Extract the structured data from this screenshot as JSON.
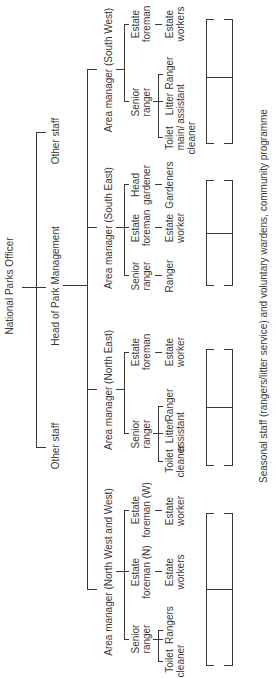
{
  "chart": {
    "top": "National Parks Officer",
    "level1": [
      {
        "label": "Other staff"
      },
      {
        "label": "Head of Park Management"
      },
      {
        "label": "Other staff"
      }
    ],
    "areas": [
      {
        "label": "Area manager (North West and West)",
        "groups": [
          {
            "head": "Senior ranger",
            "children": [
              "Toilet cleaner",
              "Rangers"
            ]
          },
          {
            "head": "Estate foreman (N)",
            "children": [
              "Estate workers"
            ]
          },
          {
            "head": "Estate foreman (W)",
            "children": [
              "Estate worker"
            ]
          }
        ]
      },
      {
        "label": "Area manager (North East)",
        "groups": [
          {
            "head": "Senior ranger",
            "children": [
              "Toilet cleaner",
              "Litter assistant",
              "Ranger"
            ]
          },
          {
            "head": "Estate foreman",
            "children": [
              "Estate worker"
            ]
          }
        ]
      },
      {
        "label": "Area manager (South East)",
        "groups": [
          {
            "head": "Senior ranger",
            "children": [
              "Ranger"
            ]
          },
          {
            "head": "Estate foreman",
            "children": [
              "Estate worker"
            ]
          },
          {
            "head": "Head gardener",
            "children": [
              "Gardeners"
            ]
          }
        ]
      },
      {
        "label": "Area manager (South West)",
        "groups": [
          {
            "head": "Senior ranger",
            "children": [
              "Toilet main/ cleaner",
              "Litter assistant",
              "Ranger"
            ]
          },
          {
            "head": "Estate foreman",
            "children": [
              "Estate workers"
            ]
          }
        ]
      }
    ],
    "footer": "Seasonal staff (rangers/litter service) and voluntary wardens, community programme"
  },
  "labels": {
    "npo": "National Parks Officer",
    "other_left": "Other staff",
    "head": "Head of Park Management",
    "other_right": "Other staff",
    "am_nw": "Area manager (North West and West)",
    "am_ne": "Area manager (North East)",
    "am_se": "Area manager (South East)",
    "am_sw": "Area manager (South West)",
    "senior_ranger": "Senior ranger",
    "toilet_cleaner": "Toilet cleaner",
    "toilet_main_cleaner": "Toilet main/ cleaner",
    "rangers": "Rangers",
    "ranger": "Ranger",
    "litter_assistant": "Litter assistant",
    "estate_foreman": "Estate foreman",
    "estate_foreman_n": "Estate foreman (N)",
    "estate_foreman_w": "Estate foreman (W)",
    "estate_worker": "Estate worker",
    "estate_workers": "Estate workers",
    "head_gardener": "Head gardener",
    "gardeners": "Gardeners",
    "footer": "Seasonal staff (rangers/litter service) and voluntary wardens, community programme"
  }
}
